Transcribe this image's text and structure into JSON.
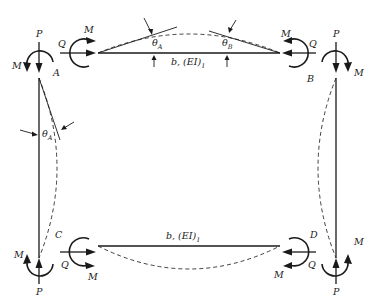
{
  "figure": {
    "joints": {
      "A": "A",
      "B": "B",
      "C": "C",
      "D": "D"
    },
    "forces": {
      "axial": "P",
      "shear": "Q",
      "moment": "M"
    },
    "top_beam": {
      "label_main": "b, (EI)",
      "label_sub": "1",
      "theta_A": "θ",
      "theta_A_sub": "A",
      "theta_B": "θ",
      "theta_B_sub": "B"
    },
    "bottom_beam": {
      "label_main": "b, (EI)",
      "label_sub": "1"
    },
    "left_column": {
      "theta_A": "θ",
      "theta_A_sub": "A"
    }
  }
}
